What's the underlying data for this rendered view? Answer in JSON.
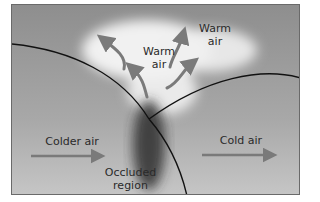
{
  "diagram": {
    "labels": {
      "warm_air_center": "Warm\nair",
      "warm_air_right": "Warm\nair",
      "colder_air": "Colder air",
      "cold_air": "Cold air",
      "occluded_region": "Occluded\nregion"
    },
    "colors": {
      "background_gray": "#9a9a9a",
      "warm_cloud": "#f4f4f4",
      "arrow_gray": "#7a7a7a",
      "front_line": "#111111",
      "occluded_dark": "#3a3a3a"
    }
  }
}
